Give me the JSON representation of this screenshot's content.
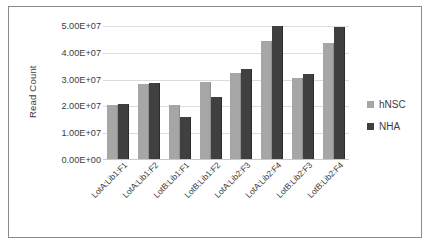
{
  "chart_data": {
    "type": "bar",
    "title": "",
    "xlabel": "",
    "ylabel": "Read Count",
    "ylim": [
      0,
      50000000
    ],
    "yticks": [
      0,
      10000000,
      20000000,
      30000000,
      40000000,
      50000000
    ],
    "ytick_labels": [
      "0.00E+00",
      "1.00E+07",
      "2.00E+07",
      "3.00E+07",
      "4.00E+07",
      "5.00E+07"
    ],
    "grid": true,
    "legend_position": "right",
    "categories": [
      "LotA:Lib1:F1",
      "LotA:Lib1:F2",
      "LotB:Lib1:F1",
      "LotB:Lib1:F2",
      "LotA:Lib2:F3",
      "LotA:Lib2:F4",
      "LotB:Lib2:F3",
      "LotB:Lib2:F4"
    ],
    "series": [
      {
        "name": "hNSC",
        "color": "#a6a6a6",
        "values": [
          20500000,
          28500000,
          20500000,
          29000000,
          32500000,
          44500000,
          30500000,
          43500000
        ]
      },
      {
        "name": "NHA",
        "color": "#404040",
        "values": [
          21000000,
          28800000,
          16000000,
          23500000,
          34000000,
          50000000,
          32000000,
          49500000
        ]
      }
    ]
  }
}
